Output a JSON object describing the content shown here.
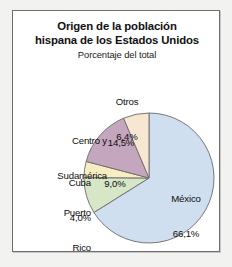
{
  "figure": {
    "title_line1": "Origen de la población",
    "title_line2": "hispana de los Estados Unidos",
    "subtitle": "Porcentaje del total"
  },
  "chart_data": {
    "type": "pie",
    "title": "Origen de la población hispana de los Estados Unidos",
    "subtitle": "Porcentaje del total",
    "xlabel": "",
    "ylabel": "Porcentaje del total",
    "units": "%",
    "total": 100.0,
    "legend_position": "callout-labels",
    "grid": false,
    "start_angle_deg": 0,
    "direction": "clockwise",
    "categories": [
      "México",
      "Puerto Rico",
      "Cuba",
      "Centro y Sudamérica",
      "Otros"
    ],
    "values": [
      66.1,
      9.0,
      4.0,
      14.5,
      6.4
    ],
    "value_labels": [
      "66,1%",
      "9,0%",
      "4,0%",
      "14,5%",
      "6,4%"
    ],
    "colors": [
      "#cfdff0",
      "#d7e6c7",
      "#f8edc2",
      "#c4a7be",
      "#f7e6d2"
    ],
    "slices": [
      {
        "name": "México",
        "value": 66.1,
        "value_label": "66,1%",
        "color": "#cfdff0",
        "label_placement": "inside",
        "label_line1": "México",
        "label_line2": "66,1%"
      },
      {
        "name": "Puerto Rico",
        "value": 9.0,
        "value_label": "9,0%",
        "color": "#d7e6c7",
        "label_placement": "outside-left",
        "label_line1": "Puerto",
        "label_line2": "Rico"
      },
      {
        "name": "Cuba",
        "value": 4.0,
        "value_label": "4,0%",
        "color": "#f8edc2",
        "label_placement": "outside-left",
        "label_line1": "Cuba",
        "label_line2": "4,0%"
      },
      {
        "name": "Centro y Sudamérica",
        "value": 14.5,
        "value_label": "14,5%",
        "color": "#c4a7be",
        "label_placement": "outside-left",
        "label_line1": "Centro y",
        "label_line2": "Sudamérica"
      },
      {
        "name": "Otros",
        "value": 6.4,
        "value_label": "6,4%",
        "color": "#f7e6d2",
        "label_placement": "outside-top",
        "label_line1": "Otros",
        "label_line2": "6,4%"
      }
    ]
  },
  "geometry": {
    "cx": 136,
    "cy": 167,
    "r": 65,
    "stroke": "#6a6a6a",
    "stroke_width": 0.9
  },
  "palette": {
    "frame_border": "#6e6e6e",
    "page_background": "#f2f2f0",
    "panel_background": "#ffffff",
    "text": "#0d0d0d"
  }
}
